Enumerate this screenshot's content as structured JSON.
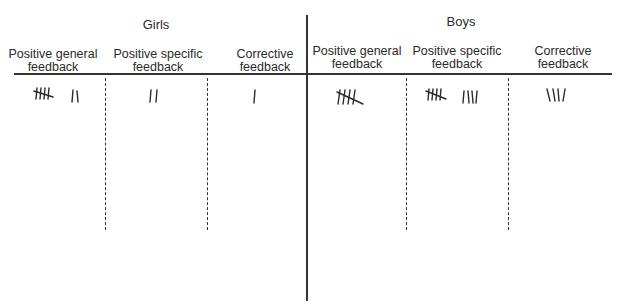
{
  "groups": [
    {
      "title": "Girls",
      "columns": [
        {
          "label": "Positive general feedback",
          "line1": "Positive general",
          "line2": "feedback",
          "tally": 7
        },
        {
          "label": "Positive specific feedback",
          "line1": "Positive specific",
          "line2": "feedback",
          "tally": 2
        },
        {
          "label": "Corrective feedback",
          "line1": "Corrective",
          "line2": "feedback",
          "tally": 1
        }
      ]
    },
    {
      "title": "Boys",
      "columns": [
        {
          "label": "Positive general feedback",
          "line1": "Positive general",
          "line2": "feedback",
          "tally": 5
        },
        {
          "label": "Positive specific feedback",
          "line1": "Positive specific",
          "line2": "feedback",
          "tally": 9
        },
        {
          "label": "Corrective feedback",
          "line1": "Corrective",
          "line2": "feedback",
          "tally": 4
        }
      ]
    }
  ],
  "colors": {
    "line": "#333333",
    "text": "#2a2a2a",
    "background": "#ffffff"
  }
}
